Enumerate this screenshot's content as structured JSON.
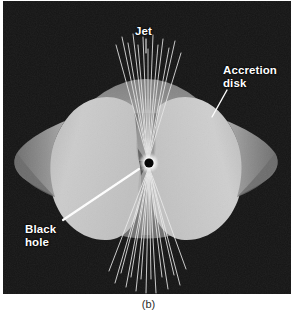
{
  "figure": {
    "caption": "(b)",
    "panel": {
      "background_color": "#151515",
      "width": 288,
      "height": 293
    },
    "labels": [
      {
        "id": "jet",
        "text": "Jet",
        "color": "#ffffff",
        "leader": "line from label down to the upper jet beams"
      },
      {
        "id": "accretion-disk",
        "text": "Accretion\ndisk",
        "color": "#ffffff",
        "leader": "line from label down-left to the right lobe surface"
      },
      {
        "id": "black-hole",
        "text": "Black\nhole",
        "color": "#ffffff",
        "leader": "line from label up-right to the central black hole"
      }
    ],
    "elements": {
      "black_hole": {
        "name": "black hole",
        "center_x": 146,
        "center_y": 162,
        "core_color": "#000000",
        "glow_color": "#ffffff"
      },
      "accretion_disk": {
        "name": "accretion disk",
        "highlight_color": "#cfcfcf",
        "body_color": "#c2c2c2",
        "shadow_color": "#8c8c8c",
        "funnel_color": "#7a7a7a"
      },
      "jet": {
        "name": "relativistic jet",
        "beam_color": "#e8e8e8",
        "beam_count_upper": 13,
        "beam_count_lower": 15,
        "direction": "bipolar, vertical"
      }
    }
  }
}
